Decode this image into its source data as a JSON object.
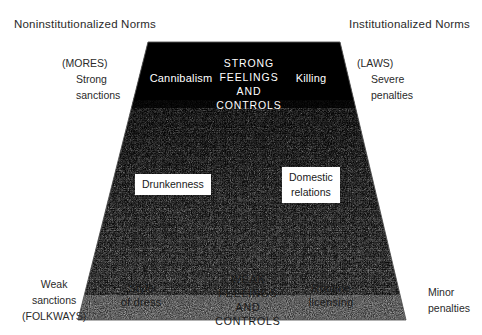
{
  "figure": {
    "title_left": "Noninstitutionalized Norms",
    "title_right": "Institutionalized Norms",
    "left_side": {
      "top_paren": "(MORES)",
      "top_line1": "Strong",
      "top_line2": "sanctions",
      "bottom_line1": "Weak",
      "bottom_line2": "sanctions",
      "bottom_paren": "(FOLKWAYS)"
    },
    "right_side": {
      "top_paren": "(LAWS)",
      "top_line1": "Severe",
      "top_line2": "penalties",
      "bottom_line1": "Minor",
      "bottom_line2": "penalties"
    },
    "top_band": {
      "left_example": "Cannibalism",
      "center_line1": "STRONG",
      "center_line2": "FEELINGS",
      "center_line3": "AND",
      "center_line4": "CONTROLS",
      "right_example": "Killing"
    },
    "middle_band": {
      "left_example": "Drunkenness",
      "right_example_line1": "Domestic",
      "right_example_line2": "relations"
    },
    "bottom_band": {
      "left_example_line1": "Style",
      "left_example_line2": "of dress",
      "center_line1": "WEAK",
      "center_line2": "FEELINGS",
      "center_line3": "AND",
      "center_line4": "CONTROLS",
      "right_example_line1": "Routine",
      "right_example_line2": "licensing"
    },
    "colors": {
      "ink": "#1a1a1a",
      "paper": "#ffffff",
      "band_dark": "#000000",
      "outline": "#555555"
    },
    "geometry": {
      "top_left_x": 148,
      "top_right_x": 340,
      "top_y": 42,
      "bottom_left_x": 78,
      "bottom_right_x": 406,
      "bottom_y": 320
    }
  }
}
